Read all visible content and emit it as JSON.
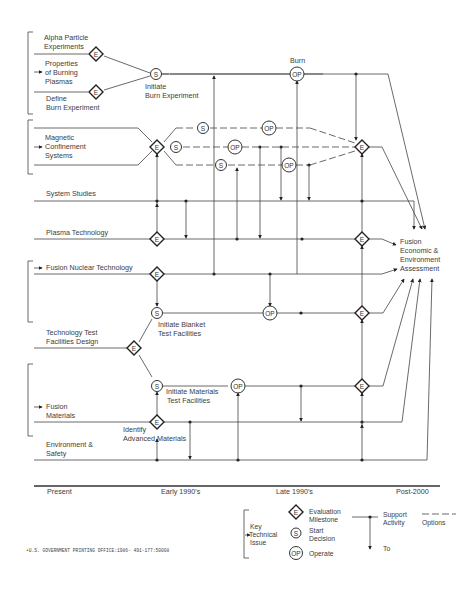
{
  "diagram": {
    "title": "",
    "tracks": {
      "alpha": "Alpha Particle",
      "alpha2": "Experiments",
      "burning1": "Properties",
      "burning2": "of Burning",
      "burning3": "Plasmas",
      "define1": "Define",
      "define2": "Burn Experiment",
      "magnetic1": "Magnetic",
      "magnetic2": "Confinement",
      "magnetic3": "Systems",
      "system_studies": "System Studies",
      "plasma_tech": "Plasma Technology",
      "fusion_nuclear": "Fusion Nuclear Technology",
      "ttf1": "Technology Test",
      "ttf2": "Facilities Design",
      "fusion_materials1": "Fusion",
      "fusion_materials2": "Materials",
      "env1": "Environment &",
      "env2": "Safety"
    },
    "annotations": {
      "initiate_burn1": "Initiate",
      "initiate_burn2": "Burn Experiment",
      "burn": "Burn",
      "initiate_blanket1": "Initiate Blanket",
      "initiate_blanket2": "Test Facilities",
      "initiate_materials1": "Initiate Materials",
      "initiate_materials2": "Test Facilities",
      "identify1": "Identify",
      "identify2": "Advanced Materials",
      "fusion_assessment1": "Fusion",
      "fusion_assessment2": "Economic &",
      "fusion_assessment3": "Environment",
      "fusion_assessment4": "Assessment"
    },
    "node_glyphs": {
      "evaluation": "E",
      "start": "S",
      "operate": "OP"
    },
    "timeline": {
      "ticks": [
        "Present",
        "Early 1990's",
        "Late 1990's",
        "Post-2000"
      ]
    }
  },
  "legend": {
    "key1": "Key",
    "key2": "Technical",
    "key3": "Issue",
    "evaluation1": "Evaluation",
    "evaluation2": "Milestone",
    "start1": "Start",
    "start2": "Decision",
    "operate": "Operate",
    "support1": "Support",
    "support2": "Activity",
    "to": "To",
    "options": "Options"
  },
  "footer": {
    "printing_office": "•U.S. GOVERNMENT PRINTING OFFICE:1986- 491-177:50008"
  }
}
